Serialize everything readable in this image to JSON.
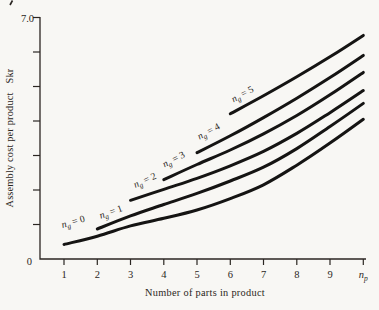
{
  "canvas": {
    "background": "#f8f7f4",
    "ink": "#2b2622",
    "curve_color": "#151413"
  },
  "chart_data": {
    "type": "line",
    "title": "",
    "xlabel": "Number of parts in product",
    "ylabel": "Assembly cost per product",
    "ylabel_unit": "Skr",
    "x_axis_symbol": {
      "base": "n",
      "sub": "p",
      "x": 10
    },
    "xlim": [
      0,
      10.3
    ],
    "ylim": [
      0,
      7.0
    ],
    "grid": false,
    "legend": "labels-on-curves",
    "x_ticks": [
      1,
      2,
      3,
      4,
      5,
      6,
      7,
      8,
      9
    ],
    "y_ticks": [
      1,
      2,
      3,
      4,
      5,
      6,
      7
    ],
    "y_top_tick_label": "7.0",
    "y_origin_label": "0",
    "series": [
      {
        "id": "ng-0",
        "label": {
          "base": "n",
          "sub": "g",
          "eq": "= 0"
        },
        "label_anchor": [
          1.3,
          0.99
        ],
        "label_angle": -16,
        "points": [
          [
            1,
            0.42
          ],
          [
            2,
            0.66
          ],
          [
            3,
            0.96
          ],
          [
            4,
            1.18
          ],
          [
            5,
            1.42
          ],
          [
            6,
            1.75
          ],
          [
            7,
            2.15
          ],
          [
            8,
            2.72
          ],
          [
            9,
            3.36
          ],
          [
            10,
            4.05
          ]
        ]
      },
      {
        "id": "ng-1",
        "label": {
          "base": "n",
          "sub": "g",
          "eq": "= 1"
        },
        "label_anchor": [
          2.44,
          1.28
        ],
        "label_angle": -20,
        "points": [
          [
            2,
            0.87
          ],
          [
            3,
            1.25
          ],
          [
            4,
            1.58
          ],
          [
            5,
            1.9
          ],
          [
            6,
            2.26
          ],
          [
            7,
            2.66
          ],
          [
            8,
            3.2
          ],
          [
            9,
            3.84
          ],
          [
            10,
            4.51
          ]
        ]
      },
      {
        "id": "ng-2",
        "label": {
          "base": "n",
          "sub": "g",
          "eq": "= 2"
        },
        "label_anchor": [
          3.47,
          2.2
        ],
        "label_angle": -24,
        "points": [
          [
            3,
            1.7
          ],
          [
            4,
            2.02
          ],
          [
            5,
            2.34
          ],
          [
            6,
            2.7
          ],
          [
            7,
            3.12
          ],
          [
            8,
            3.64
          ],
          [
            9,
            4.24
          ],
          [
            10,
            4.88
          ]
        ]
      },
      {
        "id": "ng-3",
        "label": {
          "base": "n",
          "sub": "g",
          "eq": "= 3"
        },
        "label_anchor": [
          4.34,
          2.81
        ],
        "label_angle": -27,
        "points": [
          [
            4,
            2.3
          ],
          [
            5,
            2.74
          ],
          [
            6,
            3.16
          ],
          [
            7,
            3.63
          ],
          [
            8,
            4.16
          ],
          [
            9,
            4.76
          ],
          [
            10,
            5.41
          ]
        ]
      },
      {
        "id": "ng-4",
        "label": {
          "base": "n",
          "sub": "g",
          "eq": "= 4"
        },
        "label_anchor": [
          5.39,
          3.62
        ],
        "label_angle": -28,
        "points": [
          [
            5,
            3.08
          ],
          [
            6,
            3.57
          ],
          [
            7,
            4.1
          ],
          [
            8,
            4.66
          ],
          [
            9,
            5.26
          ],
          [
            10,
            5.9
          ]
        ]
      },
      {
        "id": "ng-5",
        "label": {
          "base": "n",
          "sub": "g",
          "eq": "= 5"
        },
        "label_anchor": [
          6.41,
          4.7
        ],
        "label_angle": -28,
        "points": [
          [
            6,
            4.21
          ],
          [
            7,
            4.73
          ],
          [
            8,
            5.28
          ],
          [
            9,
            5.86
          ],
          [
            10,
            6.48
          ]
        ]
      }
    ]
  }
}
